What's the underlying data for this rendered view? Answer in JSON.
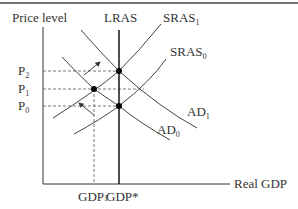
{
  "diagram": {
    "type": "AD-AS model",
    "axes": {
      "y_label": "Price level",
      "x_label": "Real GDP"
    },
    "price_levels": [
      {
        "base": "P",
        "sub": "2"
      },
      {
        "base": "P",
        "sub": "1"
      },
      {
        "base": "P",
        "sub": "0"
      }
    ],
    "gdp_labels": {
      "gdp1_base": "GDP",
      "gdp1_sub": "1",
      "gdp_star": "GDP*"
    },
    "curves": {
      "lras": "LRAS",
      "sras1_base": "SRAS",
      "sras1_sub": "1",
      "sras0_base": "SRAS",
      "sras0_sub": "0",
      "ad1_base": "AD",
      "ad1_sub": "1",
      "ad0_base": "AD",
      "ad0_sub": "0"
    },
    "colors": {
      "line": "#333333",
      "dashed": "#555555",
      "point": "#000000"
    }
  }
}
